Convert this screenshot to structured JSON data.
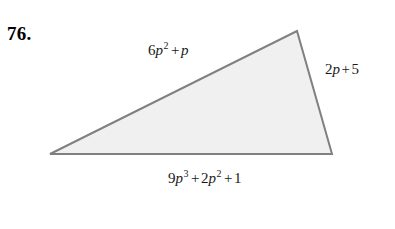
{
  "problem": {
    "number": "76."
  },
  "figure": {
    "shape_name": "triangle",
    "fill_color": "#f0f0f0",
    "stroke_color": "#808080",
    "stroke_width": 2,
    "vertices": [
      {
        "name": "left-vertex",
        "x": 50,
        "y": 154
      },
      {
        "name": "apex-vertex",
        "x": 297,
        "y": 31
      },
      {
        "name": "bottom-right-vertex",
        "x": 332,
        "y": 154
      }
    ]
  },
  "labels": {
    "top": {
      "full_text": "6p2 + p",
      "coefficient": "6",
      "variable": "p",
      "exponent": "2",
      "operator": "+",
      "second_term": "p"
    },
    "right": {
      "full_text": "2p + 5",
      "coefficient": "2",
      "variable": "p",
      "operator": "+",
      "constant": "5"
    },
    "bottom": {
      "full_text": "9p3 + 2p2 + 1",
      "term1_coefficient": "9",
      "term1_variable": "p",
      "term1_exponent": "3",
      "operator1": "+",
      "term2_coefficient": "2",
      "term2_variable": "p",
      "term2_exponent": "2",
      "operator2": "+",
      "constant": "1"
    }
  }
}
